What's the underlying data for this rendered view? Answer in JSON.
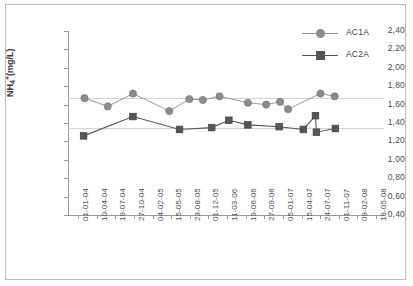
{
  "chart_data": {
    "type": "line",
    "title": "",
    "xlabel": "",
    "ylabel": "NH4+ (mg/L)",
    "ylabel_parts": {
      "base": "NH",
      "sub": "4",
      "sup": "+",
      "unit": " (mg/L)"
    },
    "ylim": [
      0.4,
      2.4
    ],
    "ytick_labels": [
      "2,40",
      "2,20",
      "2,00",
      "1,80",
      "1,60",
      "1,40",
      "1,20",
      "1,00",
      "0,80",
      "0,60",
      "0,40"
    ],
    "ytick_values": [
      2.4,
      2.2,
      2.0,
      1.8,
      1.6,
      1.4,
      1.2,
      1.0,
      0.8,
      0.6,
      0.4
    ],
    "categories": [
      "01-01-04",
      "10-04-04",
      "19-07-04",
      "27-10-04",
      "04-02-05",
      "15-05-05",
      "23-08-05",
      "01-12-05",
      "11-03-06",
      "19-06-06",
      "27-09-06",
      "05-01-07",
      "15-04-07",
      "24-07-07",
      "01-11-07",
      "09-02-08",
      "19-05-08"
    ],
    "grid": "horizontal-reference-lines-only",
    "reference_lines": [
      1.67,
      1.35
    ],
    "legend_position": "top-right",
    "series": [
      {
        "name": "AC1A",
        "marker": "circle",
        "color": "#8c8c8c",
        "points": [
          {
            "x": 0.35,
            "y": 1.67
          },
          {
            "x": 1.6,
            "y": 1.58
          },
          {
            "x": 2.95,
            "y": 1.72
          },
          {
            "x": 4.9,
            "y": 1.53
          },
          {
            "x": 5.98,
            "y": 1.66
          },
          {
            "x": 6.7,
            "y": 1.65
          },
          {
            "x": 7.6,
            "y": 1.69
          },
          {
            "x": 9.12,
            "y": 1.62
          },
          {
            "x": 10.1,
            "y": 1.6
          },
          {
            "x": 10.85,
            "y": 1.63
          },
          {
            "x": 11.28,
            "y": 1.55
          },
          {
            "x": 13.02,
            "y": 1.72
          },
          {
            "x": 13.78,
            "y": 1.69
          }
        ]
      },
      {
        "name": "AC2A",
        "marker": "square",
        "color": "#565656",
        "points": [
          {
            "x": 0.3,
            "y": 1.26
          },
          {
            "x": 2.95,
            "y": 1.47
          },
          {
            "x": 5.45,
            "y": 1.33
          },
          {
            "x": 7.18,
            "y": 1.35
          },
          {
            "x": 8.1,
            "y": 1.43
          },
          {
            "x": 9.12,
            "y": 1.38
          },
          {
            "x": 10.8,
            "y": 1.36
          },
          {
            "x": 12.1,
            "y": 1.33
          },
          {
            "x": 12.75,
            "y": 1.48
          },
          {
            "x": 12.8,
            "y": 1.3
          },
          {
            "x": 13.82,
            "y": 1.34
          }
        ]
      }
    ]
  },
  "legend": {
    "items": [
      {
        "label": "AC1A",
        "marker": "circle",
        "color": "#8c8c8c"
      },
      {
        "label": "AC2A",
        "marker": "square",
        "color": "#565656"
      }
    ]
  }
}
